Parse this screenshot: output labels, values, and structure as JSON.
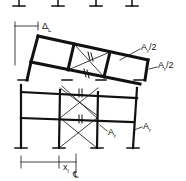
{
  "diagram": {
    "type": "structural-frame-deformation",
    "labels": {
      "drift": "Δ",
      "drift_sub": "L",
      "brace_area_half_top": "A",
      "brace_area_half_top_sub": "r",
      "brace_area_half_top_suffix": "/2",
      "brace_area_half_right": "A",
      "brace_area_half_right_sub": "r",
      "brace_area_half_right_suffix": "/2",
      "brace_area_lower_mid": "A",
      "brace_area_lower_mid_sub": "r",
      "brace_area_lower_right": "A",
      "brace_area_lower_right_sub": "r",
      "distance": "x",
      "distance_sub": "i",
      "centerline": "℄"
    }
  }
}
